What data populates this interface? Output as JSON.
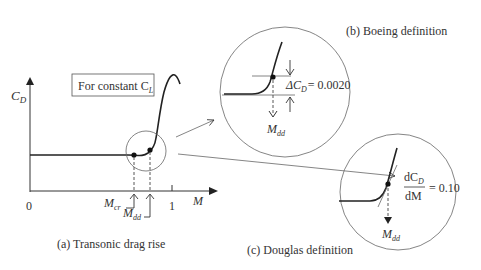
{
  "panel_a": {
    "caption": "(a) Transonic drag rise",
    "y_axis_label": "C",
    "y_axis_sub": "D",
    "x_axis_label": "M",
    "origin_label": "0",
    "tick_one_label": "1",
    "note_box": "For constant C",
    "note_box_sub": "L",
    "marker_cr_label": "M",
    "marker_cr_sub": "cr",
    "marker_dd_label": "M",
    "marker_dd_sub": "dd"
  },
  "panel_b": {
    "caption": "(b) Boeing definition",
    "delta_label": "ΔC",
    "delta_sub": "D",
    "delta_value": "= 0.0020",
    "mdd_label": "M",
    "mdd_sub": "dd"
  },
  "panel_c": {
    "caption": "(c) Douglas definition",
    "deriv_num": "dC",
    "deriv_num_sub": "D",
    "deriv_den": "dM",
    "deriv_value": "= 0.10",
    "mdd_label": "M",
    "mdd_sub": "dd"
  },
  "colors": {
    "ink": "#333333",
    "background": "#ffffff"
  }
}
